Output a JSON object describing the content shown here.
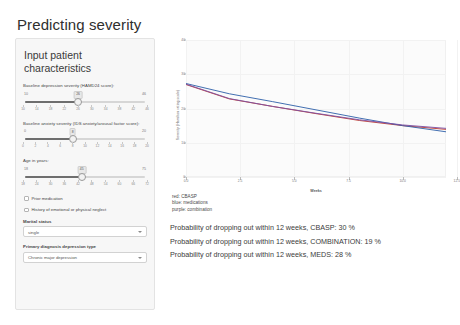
{
  "app": {
    "title": "Predicting severity"
  },
  "sidebar": {
    "heading": "Input patient characteristics",
    "sliders": [
      {
        "label": "Baseline depression severity (HAMD24 score):",
        "value": "26",
        "min_label": "10",
        "max_label": "46",
        "min": 10,
        "max": 46,
        "ticks": [
          "10",
          "14",
          "18",
          "22",
          "26",
          "30",
          "34",
          "38",
          "42",
          "46"
        ]
      },
      {
        "label": "Baseline anxiety severity (IDS anxiety/arousal factor score):",
        "value": "8",
        "min_label": "0",
        "max_label": "20",
        "min": 0,
        "max": 20,
        "ticks": [
          "0",
          "2",
          "4",
          "6",
          "8",
          "10",
          "12",
          "14",
          "16",
          "18",
          "20"
        ]
      },
      {
        "label": "Age in years:",
        "value": "45",
        "min_label": "18",
        "max_label": "75",
        "min": 18,
        "max": 75,
        "ticks": [
          "18",
          "24",
          "30",
          "36",
          "42",
          "48",
          "54",
          "60",
          "66",
          "72"
        ]
      }
    ],
    "checkboxes": [
      {
        "label": "Prior medication",
        "checked": false
      },
      {
        "label": "History of emotional or physical neglect",
        "checked": false
      }
    ],
    "selects": [
      {
        "label": "Marital status",
        "value": "single",
        "options": [
          "single",
          "married",
          "divorced",
          "widowed"
        ]
      },
      {
        "label": "Primary diagnosis depression type",
        "value": "Chronic major depression",
        "options": [
          "Chronic major depression",
          "Double depression",
          "Recurrent major depression"
        ]
      }
    ]
  },
  "chart_data": {
    "type": "line",
    "title": "",
    "xlabel": "Weeks",
    "ylabel": "Severity (Hamilton rating scale)",
    "xlim": [
      0,
      12
    ],
    "ylim": [
      0,
      40
    ],
    "xticks": [
      "0.0",
      "2.5",
      "5.0",
      "7.5",
      "10.0",
      "12.5"
    ],
    "yticks": [
      "0",
      "10",
      "20",
      "30",
      "40"
    ],
    "grid": true,
    "legend_position": "below-left",
    "x": [
      0,
      2,
      4,
      6,
      8,
      10,
      12
    ],
    "series": [
      {
        "name": "CBASP",
        "color": "#c0392b",
        "values": [
          27.0,
          22.8,
          20.6,
          18.5,
          16.5,
          15.0,
          13.9
        ]
      },
      {
        "name": "medications",
        "color": "#2c5fa8",
        "values": [
          27.3,
          24.3,
          22.0,
          19.6,
          17.2,
          15.0,
          13.2
        ]
      },
      {
        "name": "combination",
        "color": "#7b4ea3",
        "values": [
          27.1,
          22.9,
          20.6,
          18.6,
          16.7,
          15.2,
          14.2
        ]
      }
    ]
  },
  "legend": {
    "lines": [
      "red: CBASP",
      "blue: medications",
      "purple: combination"
    ]
  },
  "outputs": {
    "lines": [
      "Probability of dropping out within 12 weeks, CBASP: 30 %",
      "Probability of dropping out within 12 weeks, COMBINATION: 19 %",
      "Probability of dropping out within 12 weeks, MEDS: 28 %"
    ]
  }
}
